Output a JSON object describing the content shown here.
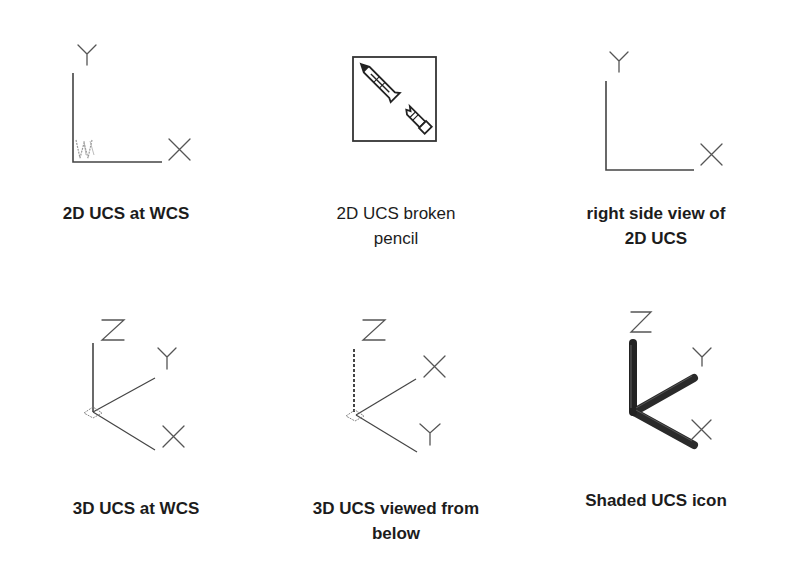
{
  "diagram": {
    "title": "",
    "panels": [
      {
        "id": "2d-ucs-at-wcs",
        "caption_lines": [
          "2D UCS at WCS"
        ],
        "axes": [
          "Y",
          "X"
        ],
        "marker": "W",
        "style": "bold"
      },
      {
        "id": "2d-ucs-broken-pencil",
        "caption_lines": [
          "2D UCS broken",
          "pencil"
        ],
        "axes": [],
        "marker": "broken-pencil",
        "style": "regular"
      },
      {
        "id": "right-side-view-2d-ucs",
        "caption_lines": [
          "right side view of",
          "2D UCS"
        ],
        "axes": [
          "Y",
          "X"
        ],
        "style": "bold"
      },
      {
        "id": "3d-ucs-at-wcs",
        "caption_lines": [
          "3D UCS at WCS"
        ],
        "axes": [
          "Z",
          "Y",
          "X"
        ],
        "style": "bold"
      },
      {
        "id": "3d-ucs-viewed-from-below",
        "caption_lines": [
          "3D UCS viewed from",
          "below"
        ],
        "axes": [
          "Z",
          "X",
          "Y"
        ],
        "style": "bold"
      },
      {
        "id": "shaded-ucs-icon",
        "caption_lines": [
          "Shaded UCS icon"
        ],
        "axes": [
          "Z",
          "Y",
          "X"
        ],
        "style": "bold"
      }
    ],
    "colors": {
      "line": "#444444",
      "letter": "#555555",
      "shaded_rod": "#2a2a2a",
      "background": "#ffffff"
    }
  }
}
